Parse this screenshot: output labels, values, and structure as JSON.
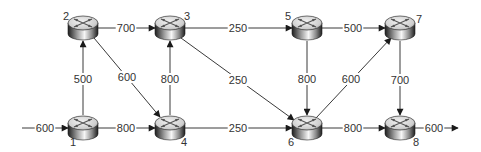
{
  "diagram": {
    "type": "network-flow",
    "nodes": [
      {
        "id": "1",
        "label": "1",
        "x": 83,
        "y": 128,
        "label_dx": -10,
        "label_dy": 18
      },
      {
        "id": "2",
        "label": "2",
        "x": 83,
        "y": 28,
        "label_dx": -17,
        "label_dy": -8
      },
      {
        "id": "3",
        "label": "3",
        "x": 170,
        "y": 28,
        "label_dx": 17,
        "label_dy": -8
      },
      {
        "id": "4",
        "label": "4",
        "x": 170,
        "y": 128,
        "label_dx": 14,
        "label_dy": 18
      },
      {
        "id": "5",
        "label": "5",
        "x": 307,
        "y": 28,
        "label_dx": -19,
        "label_dy": -8
      },
      {
        "id": "6",
        "label": "6",
        "x": 307,
        "y": 128,
        "label_dx": -16,
        "label_dy": 18
      },
      {
        "id": "7",
        "label": "7",
        "x": 400,
        "y": 28,
        "label_dx": 19,
        "label_dy": -5
      },
      {
        "id": "8",
        "label": "8",
        "x": 400,
        "y": 128,
        "label_dx": 16,
        "label_dy": 18
      }
    ],
    "edges": [
      {
        "from": "in",
        "to": "1",
        "label": "600",
        "x1": 22,
        "y1": 128,
        "x2": 68,
        "y2": 128,
        "lx": 45,
        "ly": 128
      },
      {
        "from": "1",
        "to": "2",
        "label": "500",
        "x1": 83,
        "y1": 115,
        "x2": 83,
        "y2": 41,
        "lx": 83,
        "ly": 79
      },
      {
        "from": "1",
        "to": "4",
        "label": "800",
        "x1": 98,
        "y1": 128,
        "x2": 155,
        "y2": 128,
        "lx": 126,
        "ly": 128
      },
      {
        "from": "2",
        "to": "3",
        "label": "700",
        "x1": 98,
        "y1": 28,
        "x2": 155,
        "y2": 28,
        "lx": 126,
        "ly": 28
      },
      {
        "from": "2",
        "to": "4",
        "label": "600",
        "x1": 94,
        "y1": 38,
        "x2": 160,
        "y2": 117,
        "lx": 127,
        "ly": 77
      },
      {
        "from": "4",
        "to": "3",
        "label": "800",
        "x1": 170,
        "y1": 115,
        "x2": 170,
        "y2": 41,
        "lx": 170,
        "ly": 79
      },
      {
        "from": "3",
        "to": "5",
        "label": "250",
        "x1": 185,
        "y1": 28,
        "x2": 292,
        "y2": 28,
        "lx": 238,
        "ly": 28
      },
      {
        "from": "3",
        "to": "6",
        "label": "250",
        "x1": 181,
        "y1": 38,
        "x2": 294,
        "y2": 120,
        "lx": 238,
        "ly": 80
      },
      {
        "from": "4",
        "to": "6",
        "label": "250",
        "x1": 185,
        "y1": 128,
        "x2": 292,
        "y2": 128,
        "lx": 238,
        "ly": 128
      },
      {
        "from": "5",
        "to": "7",
        "label": "500",
        "x1": 322,
        "y1": 28,
        "x2": 385,
        "y2": 28,
        "lx": 353,
        "ly": 28
      },
      {
        "from": "5",
        "to": "6",
        "label": "800",
        "x1": 307,
        "y1": 41,
        "x2": 307,
        "y2": 115,
        "lx": 307,
        "ly": 79
      },
      {
        "from": "6",
        "to": "7",
        "label": "600",
        "x1": 316,
        "y1": 118,
        "x2": 391,
        "y2": 38,
        "lx": 351,
        "ly": 79
      },
      {
        "from": "6",
        "to": "8",
        "label": "800",
        "x1": 322,
        "y1": 128,
        "x2": 385,
        "y2": 128,
        "lx": 353,
        "ly": 128
      },
      {
        "from": "7",
        "to": "8",
        "label": "700",
        "x1": 400,
        "y1": 41,
        "x2": 400,
        "y2": 115,
        "lx": 400,
        "ly": 80
      },
      {
        "from": "8",
        "to": "out",
        "label": "600",
        "x1": 415,
        "y1": 128,
        "x2": 458,
        "y2": 128,
        "lx": 434,
        "ly": 128
      }
    ],
    "colors": {
      "edge": "#3a3a3a",
      "label": "#333333",
      "router_top": "#e6e6e6",
      "router_side_light": "#f4f4f4",
      "router_side_dark": "#2a2a2a"
    }
  }
}
